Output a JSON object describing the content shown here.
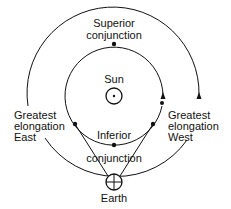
{
  "diagram": {
    "labels": {
      "superior_line1": "Superior",
      "superior_line2": "conjunction",
      "sun": "Sun",
      "inferior_line1": "Inferior",
      "inferior_line2": "conjunction",
      "east_line1": "Greatest",
      "east_line2": "elongation",
      "east_line3": "East",
      "west_line1": "Greatest",
      "west_line2": "elongation",
      "west_line3": "West",
      "earth": "Earth"
    },
    "nodes": [
      {
        "id": "sun",
        "label": "Sun",
        "symbol": "circled-dot"
      },
      {
        "id": "earth",
        "label": "Earth",
        "symbol": "circled-cross"
      },
      {
        "id": "superior-conjunction",
        "label": "Superior conjunction"
      },
      {
        "id": "inferior-conjunction",
        "label": "Inferior conjunction"
      },
      {
        "id": "greatest-elongation-east",
        "label": "Greatest elongation East"
      },
      {
        "id": "greatest-elongation-west",
        "label": "Greatest elongation West"
      }
    ],
    "edges": [
      {
        "from": "earth",
        "to": "greatest-elongation-east",
        "type": "line-of-sight"
      },
      {
        "from": "earth",
        "to": "greatest-elongation-west",
        "type": "line-of-sight"
      }
    ],
    "orbits": [
      {
        "id": "inner-planet-orbit",
        "direction": "counterclockwise"
      },
      {
        "id": "earth-orbit",
        "direction": "counterclockwise"
      }
    ],
    "colors": {
      "line": "#111111",
      "background": "#ffffff"
    }
  }
}
